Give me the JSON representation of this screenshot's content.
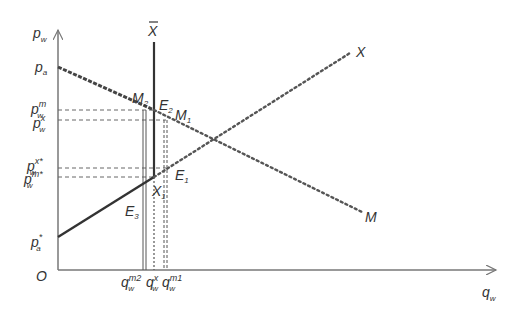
{
  "diagram": {
    "type": "supply-demand-graph",
    "colors": {
      "axis": "#777777",
      "line": "#444444",
      "guide": "#666666",
      "text": "#333333",
      "background": "#ffffff"
    },
    "axes": {
      "y_label": "p",
      "y_label_sub": "w",
      "x_label": "q",
      "x_label_sub": "w",
      "origin_label": "O"
    },
    "y_ticks": [
      {
        "id": "pa",
        "base": "p",
        "sub": "a",
        "sup": ""
      },
      {
        "id": "pwm",
        "base": "p",
        "sub": "w",
        "sup": "m"
      },
      {
        "id": "pwx",
        "base": "p",
        "sub": "w",
        "sup": "x"
      },
      {
        "id": "pwxs",
        "base": "p",
        "sub": "w",
        "sup": "x*"
      },
      {
        "id": "pwms",
        "base": "p",
        "sub": "w",
        "sup": "m*"
      },
      {
        "id": "pas",
        "base": "p",
        "sub": "a",
        "sup": "*"
      }
    ],
    "x_ticks": [
      {
        "id": "qm2",
        "base": "q",
        "sub": "w",
        "sup": "m2"
      },
      {
        "id": "qx",
        "base": "q",
        "sub": "w",
        "sup": "x"
      },
      {
        "id": "qm1",
        "base": "q",
        "sub": "w",
        "sup": "m1"
      }
    ],
    "curves": {
      "X_label": "X",
      "M_label": "M",
      "Xbar_label": "X"
    },
    "points": [
      {
        "id": "M2",
        "base": "M",
        "sub": "2"
      },
      {
        "id": "E2",
        "base": "E",
        "sub": "2"
      },
      {
        "id": "M1",
        "base": "M",
        "sub": "1"
      },
      {
        "id": "E1",
        "base": "E",
        "sub": "1"
      },
      {
        "id": "X1",
        "base": "X",
        "sub": "1"
      },
      {
        "id": "E3",
        "base": "E",
        "sub": "3"
      }
    ]
  }
}
